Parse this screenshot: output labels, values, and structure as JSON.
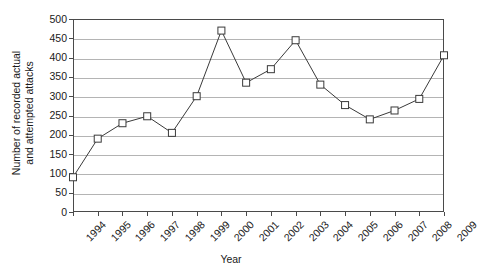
{
  "chart_data": {
    "type": "line",
    "title": "",
    "xlabel": "Year",
    "ylabel_line1": "Number of recorded actual",
    "ylabel_line2": "and attempted attacks",
    "categories": [
      "1994",
      "1995",
      "1996",
      "1997",
      "1998",
      "1999",
      "2000",
      "2001",
      "2002",
      "2003",
      "2004",
      "2005",
      "2006",
      "2007",
      "2008",
      "2009"
    ],
    "values": [
      90,
      190,
      230,
      248,
      205,
      300,
      470,
      335,
      370,
      445,
      330,
      277,
      240,
      263,
      293,
      406
    ],
    "series": [
      {
        "name": "Recorded actual and attempted attacks",
        "values": [
          90,
          190,
          230,
          248,
          205,
          300,
          470,
          335,
          370,
          445,
          330,
          277,
          240,
          263,
          293,
          406
        ]
      }
    ],
    "ylim": [
      0,
      500
    ],
    "ytick_labels": [
      "0",
      "50",
      "100",
      "150",
      "200",
      "250",
      "300",
      "350",
      "400",
      "450",
      "500"
    ],
    "ytick_values": [
      0,
      50,
      100,
      150,
      200,
      250,
      300,
      350,
      400,
      450,
      500
    ],
    "grid": "horizontal",
    "legend": "none",
    "marker": "open-square",
    "line_color": "#3a3a3a",
    "marker_fill": "#ffffff",
    "grid_color": "#b4b4b4",
    "axis_color": "#4a4a4a"
  }
}
